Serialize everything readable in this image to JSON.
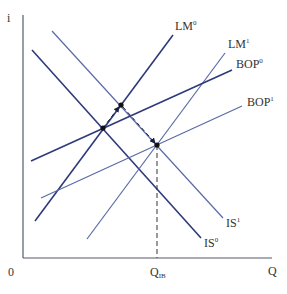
{
  "chart_data": {
    "type": "line",
    "title": "",
    "xlabel": "Q",
    "ylabel": "i",
    "origin_label": "0",
    "x_tick_labels": [
      {
        "label": "Q",
        "sub": "IB",
        "x": 157
      }
    ],
    "colors": {
      "dark": "#2e3a7a",
      "light": "#5a6aa8",
      "axis": "#555a70",
      "text": "#333333"
    },
    "series": [
      {
        "name": "IS0",
        "label": "IS",
        "sup": "0",
        "kind": "dark",
        "x1": 32,
        "y1": 50,
        "x2": 201,
        "y2": 238,
        "lx": 204,
        "ly": 247
      },
      {
        "name": "IS1",
        "label": "IS",
        "sup": "1",
        "kind": "light",
        "x1": 52,
        "y1": 31,
        "x2": 223,
        "y2": 218,
        "lx": 226,
        "ly": 227
      },
      {
        "name": "LM0",
        "label": "LM",
        "sup": "0",
        "kind": "dark",
        "x1": 35,
        "y1": 221,
        "x2": 173,
        "y2": 35,
        "lx": 175,
        "ly": 30
      },
      {
        "name": "LM1",
        "label": "LM",
        "sup": "1",
        "kind": "light",
        "x1": 87,
        "y1": 239,
        "x2": 225,
        "y2": 53,
        "lx": 228,
        "ly": 48
      },
      {
        "name": "BOP0",
        "label": "BOP",
        "sup": "0",
        "kind": "dark",
        "x1": 31,
        "y1": 161,
        "x2": 232,
        "y2": 70,
        "lx": 236,
        "ly": 68
      },
      {
        "name": "BOP1",
        "label": "BOP",
        "sup": "1",
        "kind": "light",
        "x1": 41,
        "y1": 198,
        "x2": 242,
        "y2": 106,
        "lx": 247,
        "ly": 106
      }
    ],
    "equilibrium_points": [
      {
        "name": "initial",
        "x": 103,
        "y": 128
      },
      {
        "name": "intermediate",
        "x": 121,
        "y": 105
      },
      {
        "name": "final",
        "x": 157,
        "y": 145
      }
    ],
    "arrows": [
      {
        "from": [
          103,
          128
        ],
        "to": [
          119,
          107
        ]
      },
      {
        "from": [
          123,
          107
        ],
        "to": [
          155,
          143
        ]
      }
    ],
    "dashed_guide": {
      "x": 157,
      "y_top": 145,
      "y_bottom": 258
    },
    "axes": {
      "x0": 23,
      "y0": 258,
      "x_end": 272,
      "y_top": 15
    },
    "grid": false,
    "legend": "inline labels at line ends"
  },
  "labels": {
    "y_axis": "i",
    "x_axis": "Q",
    "origin": "0",
    "q_ib_main": "Q",
    "q_ib_sub": "IB",
    "is0": "IS",
    "is0_sup": "0",
    "is1": "IS",
    "is1_sup": "1",
    "lm0": "LM",
    "lm0_sup": "0",
    "lm1": "LM",
    "lm1_sup": "1",
    "bop0": "BOP",
    "bop0_sup": "0",
    "bop1": "BOP",
    "bop1_sup": "1"
  }
}
